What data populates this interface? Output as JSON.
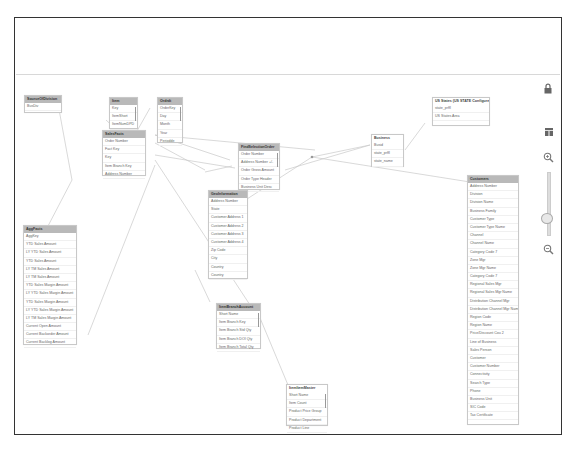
{
  "canvas": {
    "title": "Data model viewer"
  },
  "controls": {
    "lock": "lock-icon",
    "layout": "layout-icon",
    "zoom_in": "zoom-in-icon",
    "zoom_out": "zoom-out-icon",
    "zoom_slider_position": "low"
  },
  "tables": {
    "sourceofdivision": {
      "title": "SourceOfDivision",
      "fields": [
        "BusDiv",
        "#"
      ]
    },
    "item": {
      "title": "Item",
      "fields": [
        "Key",
        "ItemShort",
        "ItemNumDPD"
      ]
    },
    "ordrdt": {
      "title": "Ordrdt",
      "fields": [
        "OrderKey",
        "Day",
        "Month",
        "Year",
        "Periodde"
      ]
    },
    "salesfacts": {
      "title": "SalesFacts",
      "fields": [
        "Order Number",
        "Fact Key",
        "Key",
        "Item Branch Key",
        "Address Number"
      ]
    },
    "findselectionorder": {
      "title": "FindSelectionOrder",
      "fields": [
        "Order Number",
        "Address Number +/-",
        "Order Gross Amount",
        "Order Type Header",
        "Business Unit Desc"
      ]
    },
    "business": {
      "title": "Business",
      "fields": [
        "Busid",
        "state_prffl",
        "state_name"
      ]
    },
    "usstates": {
      "title": "US States (US STATE Configure)",
      "fields": [
        "state_prffl",
        "US States Area"
      ]
    },
    "geoinformation": {
      "title": "GeoInformation",
      "fields": [
        "Address Number",
        "State",
        "Customer Address 1",
        "Customer Address 2",
        "Customer Address 3",
        "Customer Address 4",
        "Zip Code",
        "City",
        "Country",
        "Country"
      ]
    },
    "aggfacts": {
      "title": "AggFacts",
      "fields": [
        "AggKey",
        "YTD Sales Amount",
        "LY YTD Sales Amount",
        "YTD Sales Amount",
        "LY TM Sales Amount",
        "LY TM Sales Amount",
        "YTD Sales Margin Amount",
        "LY YTD Sales Margin Amount",
        "YTD Sales Margin Amount",
        "LY YTD Sales Margin Amount",
        "LY TM Sales Margin Amount",
        "Current Open Amount",
        "Current Backorder Amount",
        "Current Backlog Amount"
      ]
    },
    "customers": {
      "title": "Customers",
      "fields": [
        "Address Number",
        "Division",
        "Division Name",
        "Business Family",
        "Customer Type",
        "Customer Type Name",
        "Channel",
        "Channel Name",
        "Category Code 7",
        "Zone Mgr",
        "Zone Mgr Name",
        "Category Code 7",
        "Regional Sales Mgr",
        "Regional Sales Mgr Name",
        "Distribution Channel Mgr",
        "Distribution Channel Mgr Name",
        "Region Code",
        "Region Name",
        "Price/Discount Cou 2",
        "Line of Business",
        "Sales Person",
        "Customer",
        "Customer Number",
        "Connectivity",
        "Search Type",
        "Phone",
        "Business Unit",
        "SIC Code",
        "Tax Certificate"
      ]
    },
    "itembranchaccount": {
      "title": "ItemBranchAccount",
      "fields": [
        "Short Name",
        "Item Branch Key",
        "Item Branch Std Qty",
        "Item Branch DOI Qty",
        "Item Branch Total Qty"
      ]
    },
    "itemitemmaster": {
      "title": "ItemItemMaster",
      "fields": [
        "Short Name",
        "Item Count",
        "Product Price Group",
        "Product Department",
        "Product Line"
      ]
    }
  }
}
